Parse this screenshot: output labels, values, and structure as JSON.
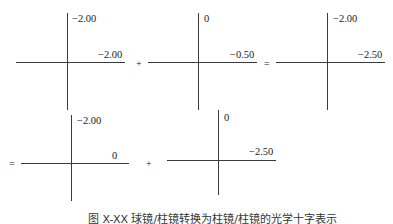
{
  "diagram": {
    "row1": {
      "cross1": {
        "vertical": "−2.00",
        "horizontal": "−2.00"
      },
      "op1": "+",
      "cross2": {
        "vertical": "0",
        "horizontal": "−0.50"
      },
      "op2": "=",
      "cross3": {
        "vertical": "−2.00",
        "horizontal": "−2.50"
      }
    },
    "row2": {
      "op0": "=",
      "cross4": {
        "vertical": "−2.00",
        "horizontal": "0"
      },
      "op1": "+",
      "cross5": {
        "vertical": "0",
        "horizontal": "−2.50"
      }
    },
    "caption": "图 X-XX 球镜/柱镜转换为柱镜/柱镜的光学十字表示"
  }
}
